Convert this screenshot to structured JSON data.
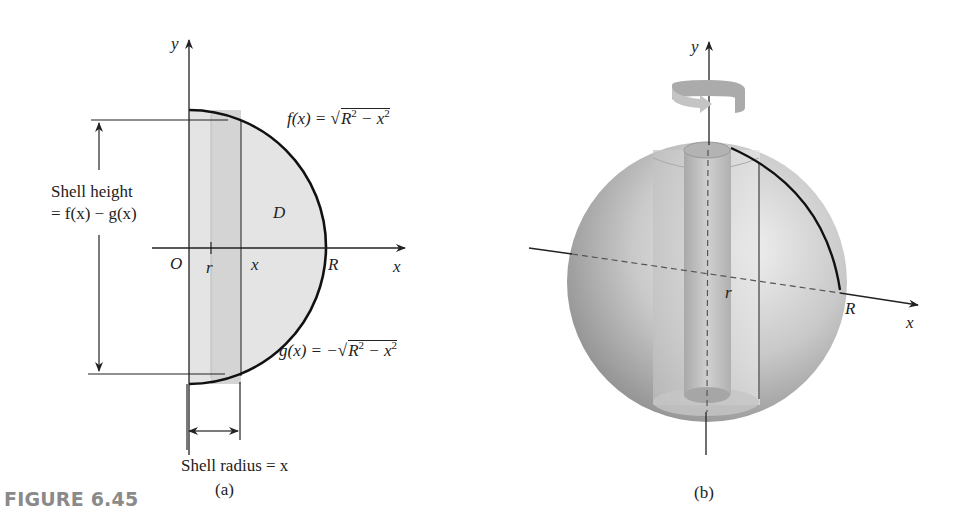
{
  "figure": {
    "label": "FIGURE 6.45",
    "label_color": "#8a8a8a"
  },
  "panel_a": {
    "caption": "(a)",
    "axis_y": "y",
    "axis_x": "x",
    "origin": "O",
    "tick_r": "r",
    "tick_x": "x",
    "point_R": "R",
    "region": "D",
    "f_lhs": "f(x) = ",
    "f_sqrt": "R",
    "f_sqrt_rest": " − x",
    "g_lhs": "g(x) = −",
    "g_sqrt": "R",
    "g_sqrt_rest": " − x",
    "exp": "2",
    "shell_height_line1": "Shell height",
    "shell_height_line2": "= f(x) − g(x)",
    "shell_radius": "Shell radius = x",
    "region_fill": "#e4e4e4",
    "strip_fill": "#d6d6d6"
  },
  "panel_b": {
    "caption": "(b)",
    "axis_y": "y",
    "axis_x": "x",
    "point_R": "R",
    "tick_r": "r",
    "sphere_fill": "#bdbdbd",
    "rotation_arrow_color": "#a9a9a9"
  }
}
